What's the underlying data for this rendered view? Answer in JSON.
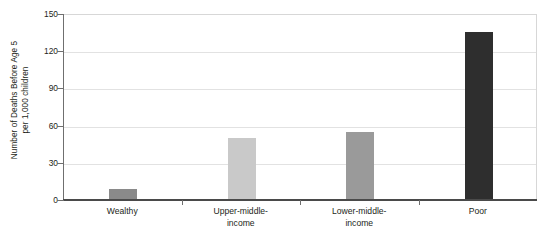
{
  "chart_data": {
    "type": "bar",
    "title": "",
    "subtitle": "",
    "xlabel": "",
    "ylabel": "Number of Deaths Before Age 5 per 1,000 children",
    "ylabel_lines": [
      "Number of Deaths Before Age 5",
      "per 1,000 children"
    ],
    "categories": [
      "Wealthy",
      "Upper-middle-income",
      "Lower-middle-income",
      "Poor"
    ],
    "category_label_lines": [
      [
        "Wealthy"
      ],
      [
        "Upper-middle-",
        "income"
      ],
      [
        "Lower-middle-",
        "income"
      ],
      [
        "Poor"
      ]
    ],
    "values": [
      8,
      49,
      54,
      135
    ],
    "bar_colors": [
      "#8a8a8a",
      "#c9c9c9",
      "#9a9a9a",
      "#2e2e2e"
    ],
    "ylim": [
      0,
      150
    ],
    "yticks": [
      0,
      30,
      60,
      90,
      120,
      150
    ],
    "ytick_labels": [
      "0",
      "30",
      "60",
      "90",
      "120",
      "150"
    ],
    "grid": true,
    "grid_axis": "y",
    "legend": false,
    "legend_position": "none",
    "background_color": "#ffffff",
    "frame_color": "#d7d7d7",
    "axis_color": "#4a4a4a",
    "gridline_color": "#e2e2e2"
  }
}
